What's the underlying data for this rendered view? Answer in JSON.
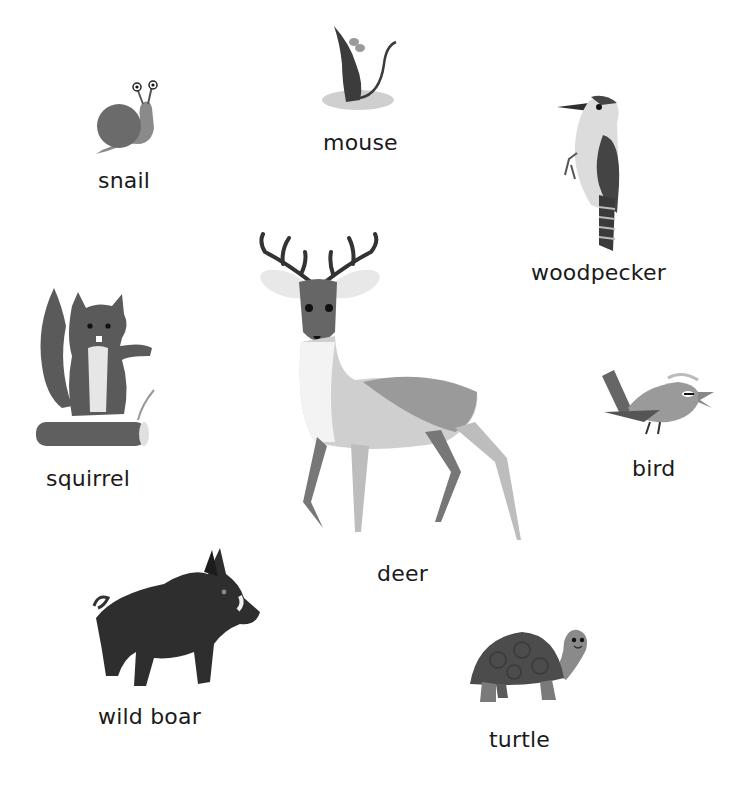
{
  "animals": [
    {
      "id": "snail",
      "label": "snail"
    },
    {
      "id": "mouse",
      "label": "mouse"
    },
    {
      "id": "woodpecker",
      "label": "woodpecker"
    },
    {
      "id": "squirrel",
      "label": "squirrel"
    },
    {
      "id": "deer",
      "label": "deer"
    },
    {
      "id": "bird",
      "label": "bird"
    },
    {
      "id": "wild_boar",
      "label": "wild boar"
    },
    {
      "id": "turtle",
      "label": "turtle"
    }
  ],
  "colors": {
    "background": "#ffffff",
    "text": "#1a1a1a",
    "dark": "#3a3a3a",
    "mid": "#6e6e6e",
    "light": "#bdbdbd"
  }
}
